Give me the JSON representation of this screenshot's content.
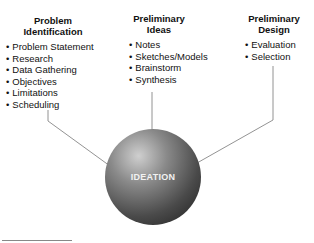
{
  "columns": [
    {
      "heading_line1": "Problem",
      "heading_line2": "Identification",
      "items": [
        "Problem Statement",
        "Research",
        "Data Gathering",
        "Objectives",
        "Limitations",
        "Scheduling"
      ]
    },
    {
      "heading_line1": "Preliminary",
      "heading_line2": "Ideas",
      "items": [
        "Notes",
        "Sketches/Models",
        "Brainstorm",
        "Synthesis"
      ]
    },
    {
      "heading_line1": "Preliminary",
      "heading_line2": "Design",
      "items": [
        "Evaluation",
        "Selection"
      ]
    }
  ],
  "center": {
    "label": "IDEATION"
  },
  "colors": {
    "line": "#777777",
    "sphere_dark": "#1c1c1c",
    "sphere_light": "#cfcfcf"
  }
}
